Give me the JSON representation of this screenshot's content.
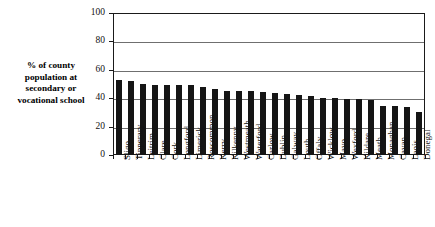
{
  "chart_data": {
    "type": "bar",
    "title": "",
    "xlabel": "",
    "ylabel": "% of county population at secondary or vocational school",
    "ylim": [
      0,
      100
    ],
    "yticks": [
      0,
      20,
      40,
      60,
      80,
      100
    ],
    "grid": true,
    "legend": null,
    "bar_color": "#151515",
    "categories": [
      "Sligo",
      "Tipperary",
      "Leitrim",
      "Clare",
      "Cork",
      "Longford",
      "Limerick",
      "Roscommon",
      "Kerry",
      "Kilkenny",
      "Westmeath",
      "Waterford",
      "Carlow",
      "Dublin",
      "Galway",
      "Louth",
      "Offaly",
      "Wicklow",
      "Mayo",
      "Wexford",
      "Kildare",
      "Meath",
      "Monaghan",
      "Cavan",
      "Laois",
      "Donegal"
    ],
    "values": [
      53,
      51.8,
      50,
      49.5,
      49.3,
      49.3,
      49,
      48,
      46.3,
      45,
      45,
      44.8,
      44.3,
      43.4,
      42.7,
      42.5,
      41.3,
      40,
      39.8,
      39.5,
      39.4,
      38.6,
      34.7,
      34.7,
      33.7,
      30
    ]
  },
  "ylabel_lines": [
    "% of county",
    "population at",
    "secondary or",
    "vocational school"
  ]
}
